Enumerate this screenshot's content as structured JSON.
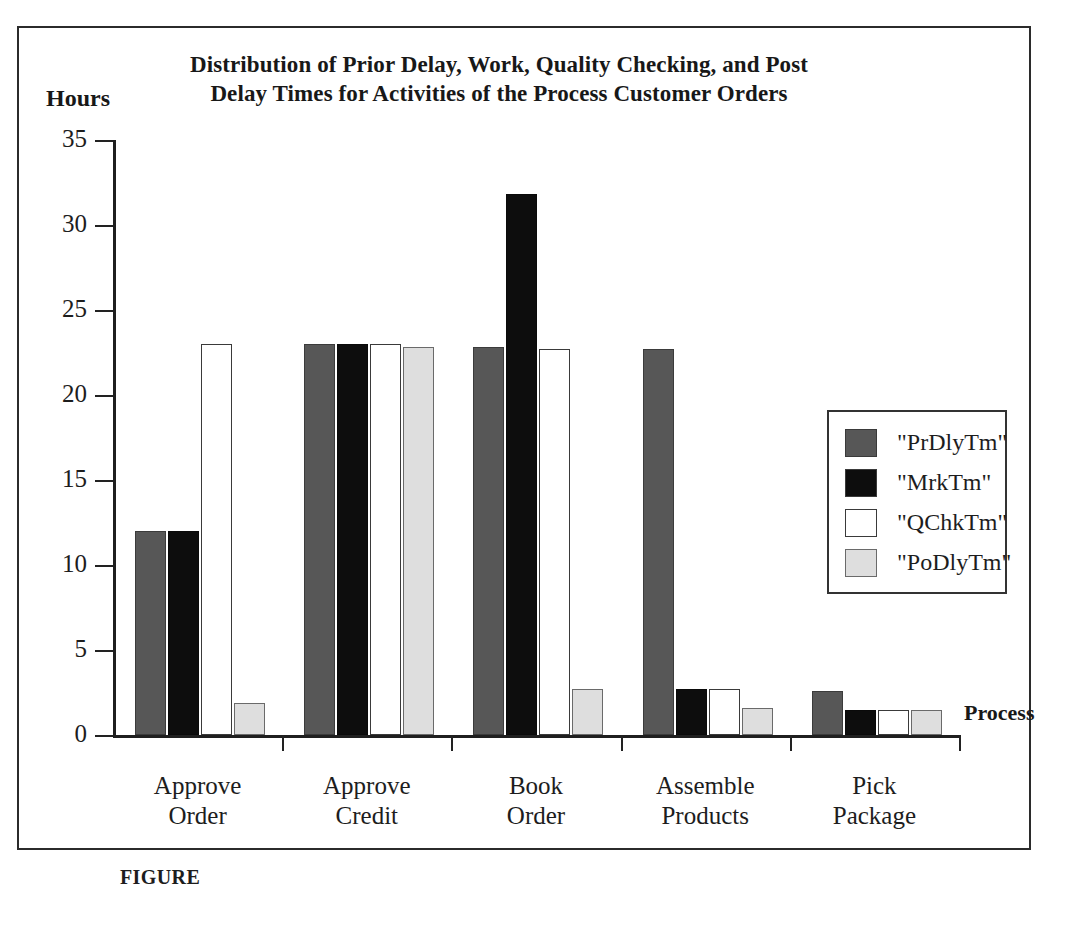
{
  "figure": {
    "caption": "FIGURE",
    "title": "Distribution of Prior Delay, Work, Quality Checking, and Post Delay Times for Activities of the Process Customer Orders"
  },
  "chart_data": {
    "type": "bar",
    "title": "Distribution of Prior Delay, Work, Quality Checking, and Post Delay Times for Activities of the Process Customer Orders",
    "xlabel": "Process",
    "ylabel": "Hours",
    "ylim": [
      0,
      35
    ],
    "yticks": [
      0,
      5,
      10,
      15,
      20,
      25,
      30,
      35
    ],
    "grid": false,
    "legend_position": "right-inside",
    "categories": [
      "Approve Order",
      "Approve Credit",
      "Book Order",
      "Assemble Products",
      "Pick Package"
    ],
    "category_lines": [
      [
        "Approve",
        "Order"
      ],
      [
        "Approve",
        "Credit"
      ],
      [
        "Book",
        "Order"
      ],
      [
        "Assemble",
        "Products"
      ],
      [
        "Pick",
        "Package"
      ]
    ],
    "series": [
      {
        "name": "\"PrDlyTm\"",
        "color": "#575757",
        "values": [
          12,
          23,
          22.8,
          22.7,
          2.6
        ]
      },
      {
        "name": "\"MrkTm\"",
        "color": "#0d0d0d",
        "values": [
          12,
          23,
          31.8,
          2.7,
          1.5
        ]
      },
      {
        "name": "\"QChkTm\"",
        "color": "#ffffff",
        "values": [
          23,
          23,
          22.7,
          2.7,
          1.5
        ]
      },
      {
        "name": "\"PoDlyTm\"",
        "color": "#dedede",
        "values": [
          1.9,
          22.8,
          2.7,
          1.6,
          1.5
        ]
      }
    ]
  },
  "legend": {
    "entries": [
      {
        "label": "\"PrDlyTm\""
      },
      {
        "label": "\"MrkTm\""
      },
      {
        "label": "\"QChkTm\""
      },
      {
        "label": "\"PoDlyTm\""
      }
    ]
  }
}
